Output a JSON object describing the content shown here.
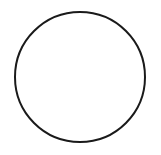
{
  "canvas": {
    "width": 161,
    "height": 155,
    "background": "#ffffff"
  },
  "shape": {
    "type": "circle",
    "cx": 80,
    "cy": 77,
    "r": 65,
    "stroke": "#1a1a1a",
    "stroke_width": 2,
    "fill": "none"
  }
}
